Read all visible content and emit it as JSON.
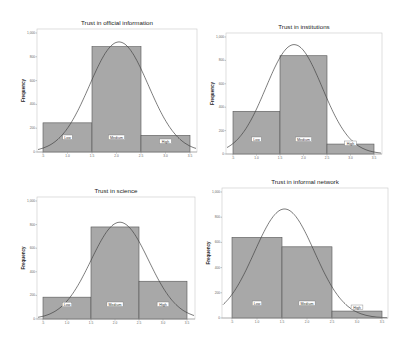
{
  "chart_data": [
    {
      "type": "bar",
      "title": "Trust in official information",
      "xlabel": "",
      "ylabel": "Frequency",
      "categories": [
        "Low",
        "Medium",
        "High"
      ],
      "values": [
        245,
        885,
        140
      ],
      "bin_edges": [
        0.5,
        1.5,
        2.5,
        3.5
      ],
      "x_ticks": [
        ".5",
        "1.0",
        "1.5",
        "2.0",
        "2.5",
        "3.0",
        "3.5"
      ],
      "y_ticks": [
        "0",
        "200",
        "400",
        "600",
        "800",
        "1,000"
      ],
      "ylim": [
        0,
        1000
      ],
      "normal_curve": {
        "peak": 925,
        "mean": 2.05
      },
      "grid": false,
      "legend": "none",
      "frame": {
        "x0": 37,
        "y0": 29,
        "x1": 197,
        "y1": 152,
        "bar_x0": 43,
        "bar_w": 49
      }
    },
    {
      "type": "bar",
      "title": "Trust in institutions",
      "xlabel": "",
      "ylabel": "Frequency",
      "categories": [
        "Low",
        "Medium",
        "High"
      ],
      "values": [
        365,
        840,
        85
      ],
      "bin_edges": [
        0.5,
        1.5,
        2.5,
        3.5
      ],
      "x_ticks": [
        ".5",
        "1.0",
        "1.5",
        "2.0",
        "2.5",
        "3.0",
        "3.5"
      ],
      "y_ticks": [
        "0",
        "200",
        "400",
        "600",
        "800",
        "1,000"
      ],
      "ylim": [
        0,
        1000
      ],
      "normal_curve": {
        "peak": 935,
        "mean": 1.8
      },
      "grid": false,
      "legend": "none",
      "frame": {
        "x0": 226,
        "y0": 33,
        "x1": 382,
        "y1": 154,
        "bar_x0": 233,
        "bar_w": 47
      }
    },
    {
      "type": "bar",
      "title": "Trust in science",
      "xlabel": "",
      "ylabel": "Frequency",
      "categories": [
        "Low",
        "Medium",
        "High"
      ],
      "values": [
        185,
        780,
        320
      ],
      "bin_edges": [
        0.5,
        1.5,
        2.5,
        3.5
      ],
      "x_ticks": [
        ".5",
        "1.0",
        "1.5",
        "2.0",
        "2.5",
        "3.0",
        "3.5"
      ],
      "y_ticks": [
        "0",
        "200",
        "400",
        "600",
        "800",
        "1,000"
      ],
      "ylim": [
        0,
        1000
      ],
      "normal_curve": {
        "peak": 820,
        "mean": 2.1
      },
      "grid": false,
      "legend": "none",
      "frame": {
        "x0": 37,
        "y0": 197,
        "x1": 195,
        "y1": 319,
        "bar_x0": 43,
        "bar_w": 48
      }
    },
    {
      "type": "bar",
      "title": "Trust in informal network",
      "xlabel": "",
      "ylabel": "Frequency",
      "categories": [
        "Low",
        "Medium",
        "High"
      ],
      "values": [
        640,
        565,
        55
      ],
      "bin_edges": [
        0.5,
        1.5,
        2.5,
        3.5
      ],
      "x_ticks": [
        ".5",
        "1.0",
        "1.5",
        "2.0",
        "2.5",
        "3.0",
        "3.5"
      ],
      "y_ticks": [
        "0",
        "200",
        "400",
        "600",
        "800",
        "1,000"
      ],
      "ylim": [
        0,
        1000
      ],
      "normal_curve": {
        "peak": 865,
        "mean": 1.55
      },
      "grid": false,
      "legend": "none",
      "frame": {
        "x0": 222,
        "y0": 188,
        "x1": 388,
        "y1": 318,
        "bar_x0": 232,
        "bar_w": 50
      }
    }
  ]
}
